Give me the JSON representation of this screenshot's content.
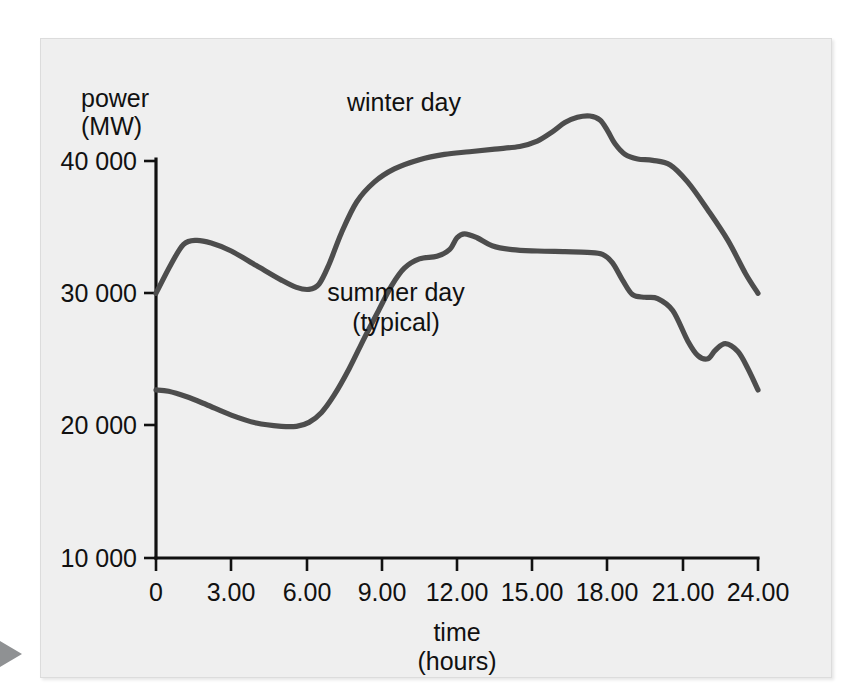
{
  "page": {
    "background_color": "#ffffff",
    "panel_color": "#efefef",
    "marker_color": "#8f9193",
    "curve_color": "#4d4d4d",
    "axis_color": "#111111"
  },
  "axes": {
    "y_title_line1": "power",
    "y_title_line2": "(MW)",
    "x_title_line1": "time",
    "x_title_line2": "(hours)",
    "y_ticks": [
      "40 000",
      "30 000",
      "20 000",
      "10 000"
    ],
    "x_ticks": [
      "0",
      "3.00",
      "6.00",
      "9.00",
      "12.00",
      "15.00",
      "18.00",
      "21.00",
      "24.00"
    ]
  },
  "labels": {
    "winter": "winter day",
    "summer_line1": "summer day",
    "summer_line2": "(typical)"
  },
  "ghost_text": [
    "as andicated in such to further",
    "Edist. so that",
    "the efficiency of electrical plant is the supply of",
    "the normal electrical demand, as",
    "in the electrical supply of the",
    "the load factor of the station",
    "to the demand that the power",
    "generated to the load as it",
    "to have a station that must be used",
    "the capacity of the station"
  ],
  "chart_data": {
    "type": "line",
    "title": "",
    "xlabel": "time (hours)",
    "ylabel": "power (MW)",
    "xlim": [
      0,
      24
    ],
    "ylim": [
      10000,
      44000
    ],
    "xticks": [
      0,
      3,
      6,
      9,
      12,
      15,
      18,
      21,
      24
    ],
    "yticks": [
      10000,
      20000,
      30000,
      40000
    ],
    "grid": false,
    "legend_position": "inline-annotations",
    "series": [
      {
        "name": "winter day",
        "color": "#4d4d4d",
        "x": [
          0,
          0.6,
          1.1,
          1.6,
          2.2,
          3.0,
          4.0,
          5.0,
          5.6,
          6.1,
          6.5,
          6.9,
          7.4,
          8.0,
          8.7,
          9.5,
          10.5,
          11.5,
          12.5,
          13.5,
          14.5,
          15.2,
          15.8,
          16.3,
          16.8,
          17.3,
          17.7,
          18.0,
          18.3,
          18.7,
          19.2,
          19.8,
          20.5,
          21.2,
          22.0,
          22.8,
          23.5,
          24.0
        ],
        "y": [
          30000,
          32200,
          33700,
          34000,
          33800,
          33200,
          32100,
          31000,
          30450,
          30300,
          30700,
          32200,
          34600,
          36900,
          38400,
          39400,
          40100,
          40500,
          40700,
          40900,
          41100,
          41500,
          42200,
          42900,
          43300,
          43400,
          43100,
          42300,
          41300,
          40500,
          40150,
          40050,
          39700,
          38400,
          36300,
          34000,
          31500,
          30000
        ]
      },
      {
        "name": "summer day (typical)",
        "color": "#4d4d4d",
        "x": [
          0,
          0.5,
          1.2,
          2.0,
          3.0,
          4.0,
          5.0,
          5.6,
          6.1,
          6.6,
          7.1,
          7.7,
          8.3,
          8.9,
          9.4,
          9.9,
          10.5,
          11.2,
          11.7,
          12.0,
          12.3,
          12.8,
          13.4,
          14.2,
          15.2,
          16.3,
          17.2,
          17.8,
          18.2,
          18.6,
          19.0,
          19.5,
          20.0,
          20.6,
          21.2,
          21.6,
          22.0,
          22.3,
          22.7,
          23.2,
          23.6,
          24.0
        ],
        "y": [
          22700,
          22600,
          22200,
          21600,
          20800,
          20200,
          19950,
          19950,
          20250,
          21000,
          22300,
          24300,
          26600,
          28800,
          30600,
          31900,
          32600,
          32800,
          33300,
          34200,
          34500,
          34200,
          33600,
          33300,
          33200,
          33150,
          33100,
          32950,
          32300,
          31000,
          29900,
          29700,
          29600,
          28700,
          26400,
          25300,
          25050,
          25700,
          26200,
          25600,
          24300,
          22700
        ]
      }
    ]
  }
}
